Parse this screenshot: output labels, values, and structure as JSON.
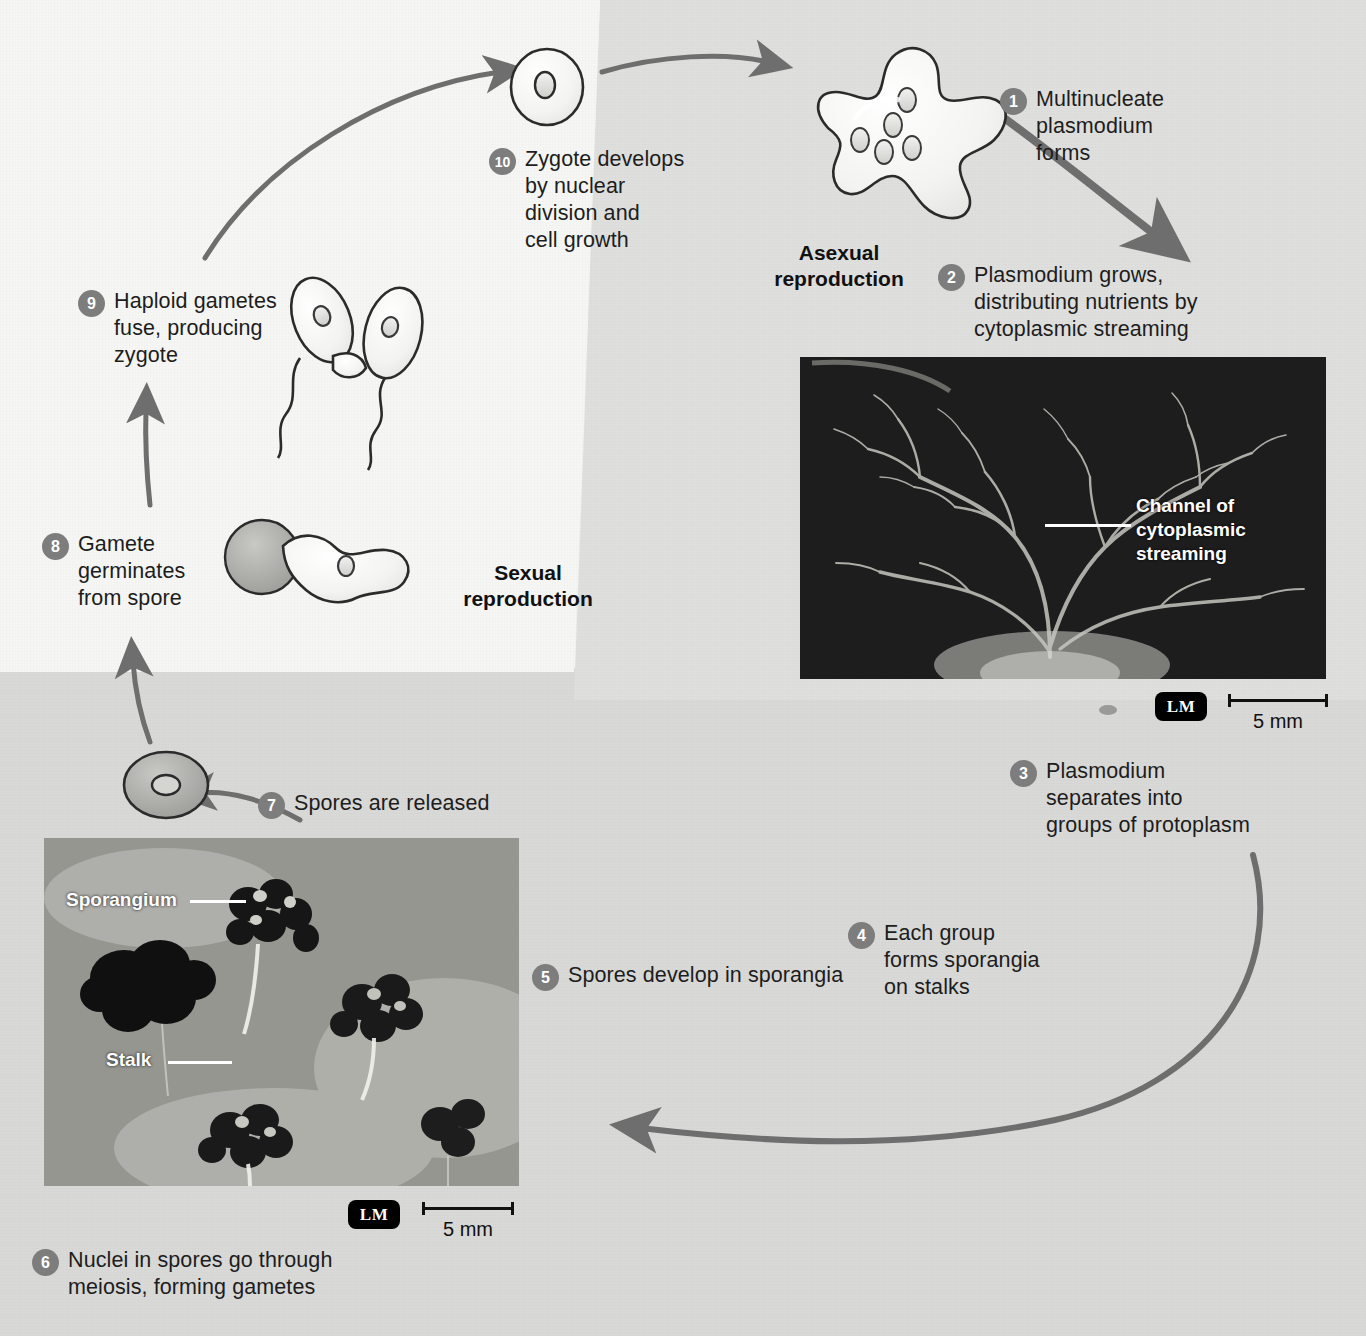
{
  "figure": {
    "sections": [
      {
        "id": "asexual",
        "label": "Asexual\nreproduction"
      },
      {
        "id": "sexual",
        "label": "Sexual\nreproduction"
      }
    ]
  },
  "steps": [
    {
      "n": "1",
      "text": "Multinucleate\nplasmodium\nforms"
    },
    {
      "n": "2",
      "text": "Plasmodium grows,\ndistributing nutrients by\ncytoplasmic streaming"
    },
    {
      "n": "3",
      "text": "Plasmodium\nseparates into\ngroups of protoplasm"
    },
    {
      "n": "4",
      "text": "Each group\nforms sporangia\non stalks"
    },
    {
      "n": "5",
      "text": "Spores develop in sporangia"
    },
    {
      "n": "6",
      "text": "Nuclei in spores go through\nmeiosis, forming gametes"
    },
    {
      "n": "7",
      "text": "Spores are released"
    },
    {
      "n": "8",
      "text": "Gamete\ngerminates\nfrom spore"
    },
    {
      "n": "9",
      "text": "Haploid gametes\nfuse, producing\nzygote"
    },
    {
      "n": "10",
      "text": "Zygote develops\nby nuclear\ndivision and\ncell growth"
    }
  ],
  "micrographs": [
    {
      "id": "plasmodium",
      "labels": [
        {
          "text": "Channel of\ncytoplasmic\nstreaming"
        }
      ],
      "technique": "LM",
      "scale": "5 mm"
    },
    {
      "id": "sporangia",
      "labels": [
        {
          "text": "Sporangium"
        },
        {
          "text": "Stalk"
        }
      ],
      "technique": "LM",
      "scale": "5 mm"
    }
  ],
  "colors": {
    "bullet": "#7d7d7d",
    "arrow": "#6e6e6e",
    "panel_light": "#f6f6f4",
    "panel_mid": "#f2f2f0",
    "panel_asexual": "#dfdfdd",
    "panel_bottom": "#d9d9d7",
    "text": "#1d1d1d",
    "micrograph_label": "#ffffff"
  }
}
